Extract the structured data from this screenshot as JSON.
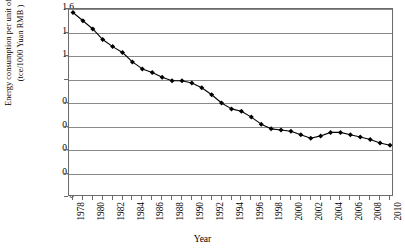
{
  "chart_data": {
    "type": "line",
    "title": "",
    "xlabel": "Year",
    "ylabel": "Energy consumption per unit of GDP (tce/1000 Yuan RMB )",
    "ylabel_line1": "Energy consumption per unit of GDP",
    "ylabel_line2": "(tce/1000 Yuan RMB )",
    "ylim": [
      0,
      1.6
    ],
    "xlim": [
      1978,
      2010
    ],
    "grid": true,
    "legend": "none",
    "marker": "diamond",
    "y_ticks": [
      "0",
      "0.2",
      "0.4",
      "0.6",
      "0.8",
      "1",
      "1.2",
      "1.4",
      "1.6"
    ],
    "y_tick_values": [
      0,
      0.2,
      0.4,
      0.6,
      0.8,
      1.0,
      1.2,
      1.4,
      1.6
    ],
    "x_tick_labels": [
      "1978",
      "",
      "1980",
      "",
      "1982",
      "",
      "1984",
      "",
      "1986",
      "",
      "1988",
      "",
      "1990",
      "",
      "1992",
      "",
      "1994",
      "",
      "1996",
      "",
      "1998",
      "",
      "2000",
      "",
      "2002",
      "",
      "2004",
      "",
      "2006",
      "",
      "2008",
      "",
      "2010"
    ],
    "x": [
      1978,
      1979,
      1980,
      1981,
      1982,
      1983,
      1984,
      1985,
      1986,
      1987,
      1988,
      1989,
      1990,
      1991,
      1992,
      1993,
      1994,
      1995,
      1996,
      1997,
      1998,
      1999,
      2000,
      2001,
      2002,
      2003,
      2004,
      2005,
      2006,
      2007,
      2008,
      2009,
      2010
    ],
    "categories": [
      "1978",
      "1979",
      "1980",
      "1981",
      "1982",
      "1983",
      "1984",
      "1985",
      "1986",
      "1987",
      "1988",
      "1989",
      "1990",
      "1991",
      "1992",
      "1993",
      "1994",
      "1995",
      "1996",
      "1997",
      "1998",
      "1999",
      "2000",
      "2001",
      "2002",
      "2003",
      "2004",
      "2005",
      "2006",
      "2007",
      "2008",
      "2009",
      "2010"
    ],
    "values": [
      1.57,
      1.5,
      1.43,
      1.34,
      1.28,
      1.23,
      1.15,
      1.09,
      1.06,
      1.02,
      0.99,
      0.99,
      0.97,
      0.93,
      0.87,
      0.8,
      0.75,
      0.73,
      0.68,
      0.62,
      0.58,
      0.57,
      0.56,
      0.53,
      0.5,
      0.52,
      0.55,
      0.55,
      0.53,
      0.51,
      0.49,
      0.46,
      0.44
    ],
    "series": [
      {
        "name": "Energy consumption per unit of GDP",
        "color": "#000000",
        "values": [
          1.57,
          1.5,
          1.43,
          1.34,
          1.28,
          1.23,
          1.15,
          1.09,
          1.06,
          1.02,
          0.99,
          0.99,
          0.97,
          0.93,
          0.87,
          0.8,
          0.75,
          0.73,
          0.68,
          0.62,
          0.58,
          0.57,
          0.56,
          0.53,
          0.5,
          0.52,
          0.55,
          0.55,
          0.53,
          0.51,
          0.49,
          0.46,
          0.44
        ]
      }
    ]
  },
  "colors": {
    "line": "#000000",
    "marker": "#000000",
    "grid": "#8a8a8a",
    "frame": "#6b6b6b",
    "background": "#ffffff"
  }
}
